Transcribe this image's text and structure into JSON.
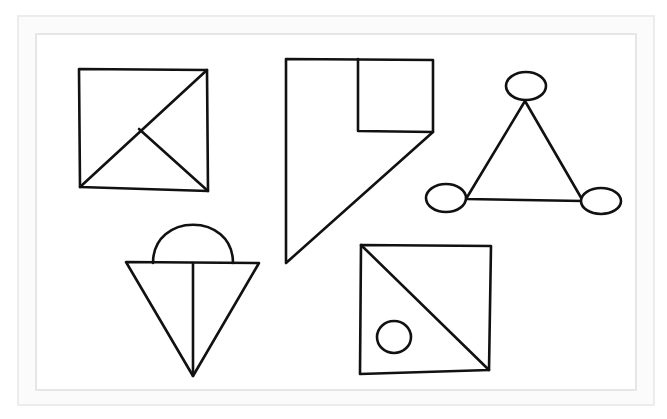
{
  "diagram": {
    "stroke_color": "#111111",
    "frame_outer_color": "#ececec",
    "frame_inner_color": "#e6e6e6",
    "shapes": [
      {
        "id": "square-with-triangles",
        "description": "Square split by a diagonal from bottom-left to top-right, with a line from the diagonal midpoint to the bottom-right corner",
        "outline": [
          [
            79,
            69
          ],
          [
            207,
            70
          ],
          [
            208,
            191
          ],
          [
            80,
            187
          ]
        ],
        "lines": [
          [
            [
              80,
              187
            ],
            [
              207,
              70
            ]
          ],
          [
            [
              139,
              129
            ],
            [
              208,
              191
            ]
          ]
        ]
      },
      {
        "id": "flag-with-square",
        "description": "Polygon with a small square in the top-right and a long diagonal down to the bottom-left point",
        "outline": [
          [
            286,
            59
          ],
          [
            433,
            60
          ],
          [
            433,
            132
          ],
          [
            286,
            263
          ]
        ],
        "inner_square": [
          [
            358,
            59
          ],
          [
            433,
            60
          ],
          [
            433,
            132
          ],
          [
            358,
            131
          ]
        ]
      },
      {
        "id": "triangle-with-ellipses",
        "description": "Triangle with an ellipse at each vertex",
        "triangle": [
          [
            525,
            101
          ],
          [
            466,
            199
          ],
          [
            583,
            201
          ]
        ],
        "ellipses": [
          {
            "cx": 526,
            "cy": 86,
            "rx": 20,
            "ry": 14
          },
          {
            "cx": 446,
            "cy": 198,
            "rx": 20,
            "ry": 14
          },
          {
            "cx": 601,
            "cy": 201,
            "rx": 20,
            "ry": 13
          }
        ]
      },
      {
        "id": "inverted-triangle-with-dome",
        "description": "Downward-pointing triangle split vertically, with a semicircle on top",
        "triangle": [
          [
            126,
            262
          ],
          [
            259,
            263
          ],
          [
            193,
            376
          ]
        ],
        "vertical_line": [
          [
            193,
            263
          ],
          [
            193,
            376
          ]
        ],
        "semicircle": {
          "x1": 153,
          "x2": 233,
          "base_y": 263,
          "top_y": 225
        }
      },
      {
        "id": "square-with-diagonal-and-circle",
        "description": "Square split by a diagonal from top-left to bottom-right, with a small circle in the lower-left half",
        "outline": [
          [
            361,
            245
          ],
          [
            491,
            246
          ],
          [
            489,
            370
          ],
          [
            360,
            374
          ]
        ],
        "diagonal": [
          [
            361,
            245
          ],
          [
            489,
            370
          ]
        ],
        "circle": {
          "cx": 394,
          "cy": 337,
          "rx": 17,
          "ry": 16
        }
      }
    ]
  }
}
